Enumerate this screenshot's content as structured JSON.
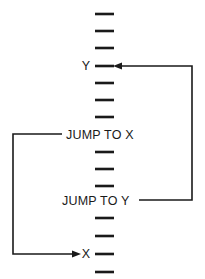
{
  "figure": {
    "kind": "program-flow-diagram",
    "background_color": "#ffffff",
    "ink_color": "#1a1a1a",
    "description_note": "Vertical sequence of instruction dashes with two labeled jump instructions and two labeled jump targets connected by routed flow lines."
  },
  "labels": {
    "target_y": "Y",
    "target_x": "X",
    "jump_to_x": "JUMP TO X",
    "jump_to_y": "JUMP TO Y"
  },
  "program_lines": [
    {
      "index": 0,
      "y": 14,
      "type": "dash",
      "label": ""
    },
    {
      "index": 1,
      "y": 31,
      "type": "dash",
      "label": ""
    },
    {
      "index": 2,
      "y": 48,
      "type": "dash",
      "label": ""
    },
    {
      "index": 3,
      "y": 66,
      "type": "dash",
      "label": "Y"
    },
    {
      "index": 4,
      "y": 83,
      "type": "dash",
      "label": ""
    },
    {
      "index": 5,
      "y": 100,
      "type": "dash",
      "label": ""
    },
    {
      "index": 6,
      "y": 117,
      "type": "dash",
      "label": ""
    },
    {
      "index": 7,
      "y": 134,
      "type": "text",
      "label": "JUMP TO X"
    },
    {
      "index": 8,
      "y": 152,
      "type": "dash",
      "label": ""
    },
    {
      "index": 9,
      "y": 169,
      "type": "dash",
      "label": ""
    },
    {
      "index": 10,
      "y": 186,
      "type": "dash",
      "label": ""
    },
    {
      "index": 11,
      "y": 200,
      "type": "text",
      "label": "JUMP TO Y"
    },
    {
      "index": 12,
      "y": 218,
      "type": "dash",
      "label": ""
    },
    {
      "index": 13,
      "y": 236,
      "type": "dash",
      "label": ""
    },
    {
      "index": 14,
      "y": 254,
      "type": "dash",
      "label": "X"
    },
    {
      "index": 15,
      "y": 272,
      "type": "dash",
      "label": ""
    }
  ],
  "flows": [
    {
      "name": "jump-to-y-flow",
      "from_label": "JUMP TO Y",
      "to_label": "Y",
      "side": "right",
      "from_y": 200,
      "to_y": 66,
      "rail_x": 192,
      "arrow_direction": "left",
      "arrow_tip_x": 113
    },
    {
      "name": "jump-to-x-flow",
      "from_label": "JUMP TO X",
      "to_label": "X",
      "side": "left",
      "from_y": 134,
      "to_y": 254,
      "rail_x": 13,
      "arrow_direction": "right",
      "arrow_tip_x": 81
    }
  ]
}
